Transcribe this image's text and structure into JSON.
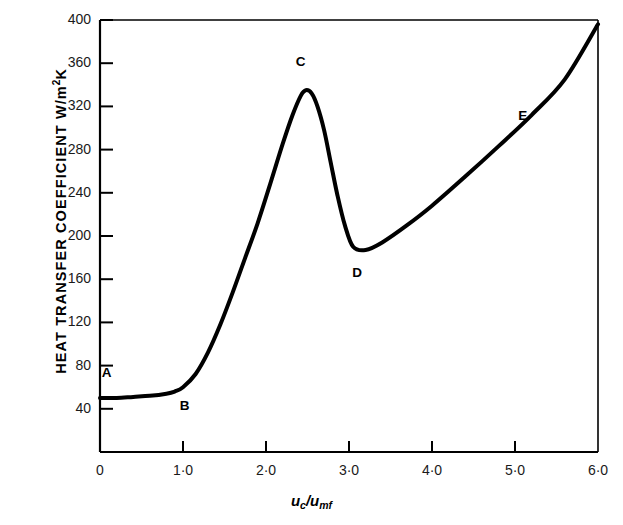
{
  "chart_data": {
    "type": "line",
    "title": "",
    "xlabel": "uc/umf",
    "xlabel_parts": {
      "base1": "u",
      "sub1": "c",
      "slash": "/",
      "base2": "u",
      "sub2": "mf"
    },
    "ylabel": "HEAT TRANSFER COEFFICIENT  W/m2K",
    "ylabel_parts": {
      "main": "HEAT TRANSFER COEFFICIENT  W/m",
      "sup": "2",
      "tail": "K"
    },
    "xlim": [
      0,
      6.0
    ],
    "ylim": [
      0,
      400
    ],
    "grid": false,
    "legend": null,
    "xticks": [
      {
        "value": 0,
        "label": "0"
      },
      {
        "value": 1.0,
        "label": "1·0"
      },
      {
        "value": 2.0,
        "label": "2·0"
      },
      {
        "value": 3.0,
        "label": "3·0"
      },
      {
        "value": 4.0,
        "label": "4·0"
      },
      {
        "value": 5.0,
        "label": "5·0"
      },
      {
        "value": 6.0,
        "label": "6·0"
      }
    ],
    "yticks": [
      {
        "value": 40,
        "label": "40"
      },
      {
        "value": 80,
        "label": "80"
      },
      {
        "value": 120,
        "label": "120"
      },
      {
        "value": 160,
        "label": "160"
      },
      {
        "value": 200,
        "label": "200"
      },
      {
        "value": 240,
        "label": "240"
      },
      {
        "value": 280,
        "label": "280"
      },
      {
        "value": 320,
        "label": "320"
      },
      {
        "value": 360,
        "label": "360"
      },
      {
        "value": 400,
        "label": "400"
      }
    ],
    "series": [
      {
        "name": "heat transfer coefficient curve",
        "color": "#000000",
        "linewidth": 4,
        "x": [
          0.0,
          0.2,
          0.4,
          0.6,
          0.8,
          0.9,
          1.0,
          1.15,
          1.3,
          1.45,
          1.6,
          1.75,
          1.9,
          2.05,
          2.2,
          2.32,
          2.42,
          2.48,
          2.55,
          2.62,
          2.7,
          2.78,
          2.86,
          2.95,
          3.05,
          3.2,
          3.4,
          3.7,
          4.0,
          4.4,
          4.8,
          5.2,
          5.6,
          6.0
        ],
        "y": [
          50,
          50,
          51,
          52,
          54,
          56,
          60,
          72,
          92,
          118,
          148,
          180,
          212,
          248,
          285,
          312,
          330,
          335,
          332,
          320,
          298,
          268,
          238,
          210,
          190,
          187,
          194,
          210,
          228,
          255,
          283,
          312,
          345,
          396
        ]
      }
    ],
    "annotations": [
      {
        "label": "A",
        "x": 0.08,
        "y": 72,
        "point_x": 0.0,
        "point_y": 50
      },
      {
        "label": "B",
        "x": 1.02,
        "y": 42,
        "point_x": 0.9,
        "point_y": 56
      },
      {
        "label": "C",
        "x": 2.42,
        "y": 360,
        "point_x": 2.48,
        "point_y": 335
      },
      {
        "label": "D",
        "x": 3.1,
        "y": 165,
        "point_x": 3.1,
        "point_y": 187
      },
      {
        "label": "E",
        "x": 5.1,
        "y": 310,
        "point_x": 5.05,
        "point_y": 300
      }
    ],
    "axis_color": "#000000",
    "background": "#ffffff"
  },
  "figure": {
    "frame": {
      "left": 100,
      "top": 20,
      "right": 598,
      "bottom": 452
    }
  }
}
